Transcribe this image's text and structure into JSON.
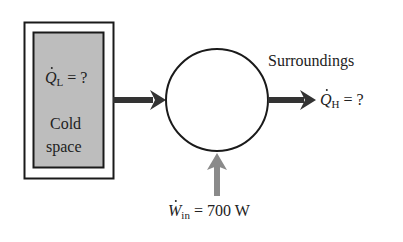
{
  "diagram": {
    "cold_space": {
      "heat_symbol": "Q",
      "heat_subscript": "L",
      "heat_value": " = ?",
      "label_line1": "Cold",
      "label_line2": "space",
      "fill_color": "#bdbdbd"
    },
    "device": {
      "shape": "circle"
    },
    "surroundings": {
      "label": "Surroundings",
      "heat_symbol": "Q",
      "heat_subscript": "H",
      "heat_value": " = ?"
    },
    "work_input": {
      "symbol": "W",
      "subscript": "in",
      "value": " = 700 W",
      "arrow_color": "#8a8a8a"
    },
    "arrow_color": "#333333"
  }
}
